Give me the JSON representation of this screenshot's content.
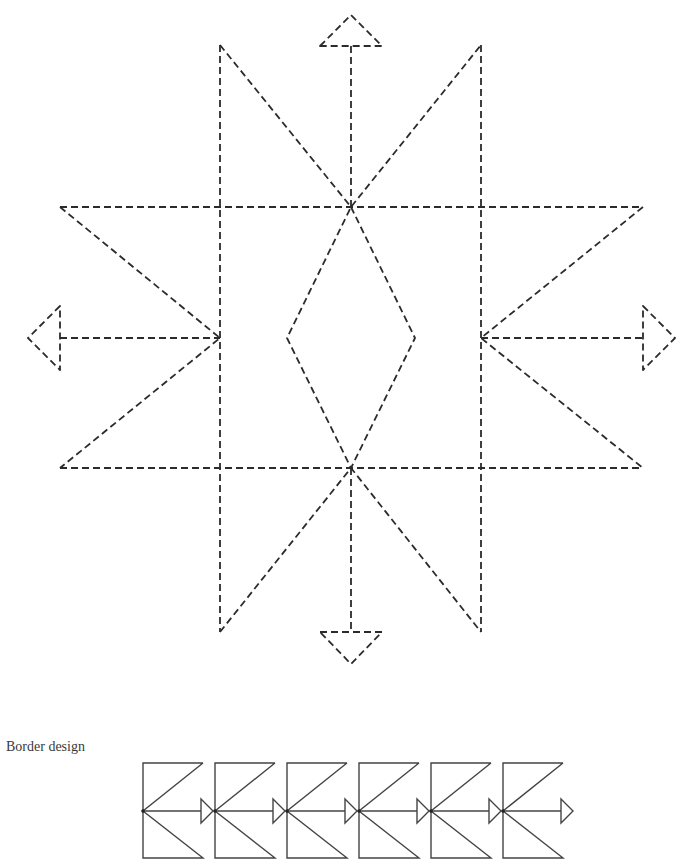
{
  "caption": "Border design",
  "colors": {
    "line": "#2b2b2b",
    "border_line": "#444444",
    "background": "#ffffff"
  },
  "star_pattern": {
    "style": "dashed",
    "vertical_lines_x": [
      220,
      481
    ],
    "horizontal_lines_y": [
      207,
      468
    ],
    "center_points": {
      "top": [
        351,
        207
      ],
      "bottom": [
        351,
        468
      ],
      "left": [
        220,
        338
      ],
      "right": [
        481,
        338
      ]
    },
    "diamond": [
      [
        351,
        207
      ],
      [
        415,
        338
      ],
      [
        351,
        468
      ],
      [
        287,
        338
      ]
    ],
    "arrows": [
      "up",
      "down",
      "left",
      "right"
    ]
  },
  "border_design": {
    "style": "solid",
    "unit_count": 6,
    "start_x": 143,
    "unit_width": 72,
    "top_y": 763,
    "mid_y": 811,
    "bottom_y": 858
  }
}
